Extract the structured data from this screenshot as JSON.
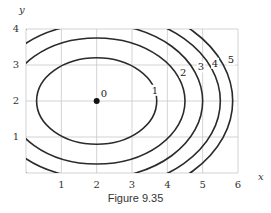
{
  "chart_data": {
    "type": "contour",
    "title": "",
    "xlabel": "x",
    "ylabel": "y",
    "xlim": [
      0,
      6
    ],
    "ylim": [
      0,
      4
    ],
    "xticks": [
      1,
      2,
      3,
      4,
      5,
      6
    ],
    "yticks": [
      1,
      2,
      3,
      4
    ],
    "grid": true,
    "center": {
      "x": 2,
      "y": 2,
      "label": "0"
    },
    "levels": [
      {
        "value": 1,
        "label": "1",
        "semi_axis_x": 1.7,
        "semi_axis_y": 1.2,
        "label_at": [
          3.65,
          2.2
        ]
      },
      {
        "value": 2,
        "label": "2",
        "semi_axis_x": 2.5,
        "semi_axis_y": 1.75,
        "label_at": [
          4.45,
          2.7
        ]
      },
      {
        "value": 3,
        "label": "3",
        "semi_axis_x": 3.0,
        "semi_axis_y": 2.15,
        "label_at": [
          4.95,
          2.85
        ]
      },
      {
        "value": 4,
        "label": "4",
        "semi_axis_x": 3.5,
        "semi_axis_y": 2.45,
        "label_at": [
          5.35,
          2.95
        ]
      },
      {
        "value": 5,
        "label": "5",
        "semi_axis_x": 3.85,
        "semi_axis_y": 2.75,
        "label_at": [
          5.8,
          3.05
        ]
      }
    ]
  },
  "caption": "Figure 9.35"
}
